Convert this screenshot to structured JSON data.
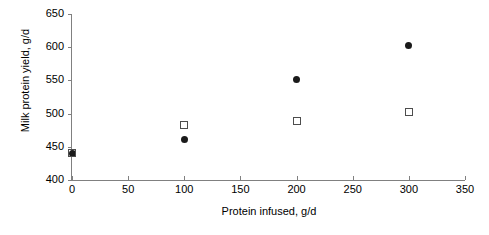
{
  "chart_data": {
    "type": "scatter",
    "title": "",
    "xlabel": "Protein infused, g/d",
    "ylabel": "Milk protein yield, g/d",
    "xlim": [
      0,
      350
    ],
    "ylim": [
      400,
      650
    ],
    "x_ticks": [
      0,
      50,
      100,
      150,
      200,
      250,
      300,
      350
    ],
    "y_ticks": [
      400,
      450,
      500,
      550,
      600,
      650
    ],
    "grid": false,
    "legend": "none",
    "series": [
      {
        "name": "filled-circle-series",
        "marker": "filled-circle",
        "color": "#1a1a1a",
        "x": [
          0,
          100,
          200,
          300
        ],
        "values": [
          440,
          461,
          551,
          602
        ]
      },
      {
        "name": "open-square-series",
        "marker": "open-square",
        "color": "#4d4d4d",
        "x": [
          0,
          100,
          200,
          300
        ],
        "values": [
          440,
          483,
          489,
          503
        ]
      }
    ]
  }
}
